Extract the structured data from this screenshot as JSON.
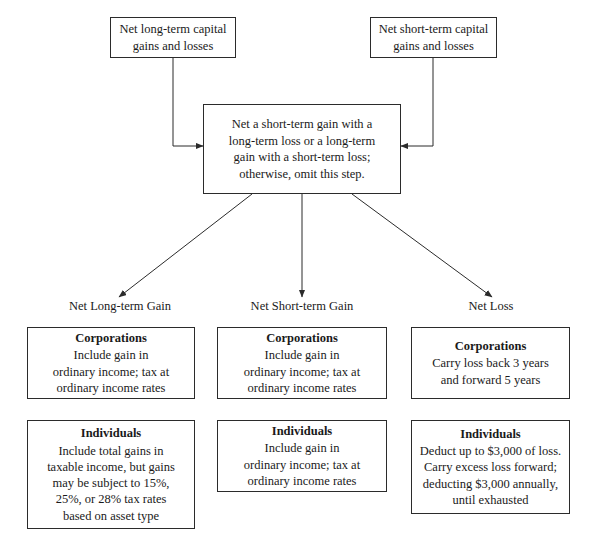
{
  "diagram": {
    "title_artifact": "",
    "stroke_color": "#2b2b2b",
    "background_color": "#ffffff",
    "sources": [
      {
        "id": "net-long-term",
        "text": "Net long-term capital\ngains and losses"
      },
      {
        "id": "net-short-term",
        "text": "Net short-term capital\ngains and losses"
      }
    ],
    "process": {
      "id": "netting-step",
      "text": "Net a short-term gain with a\nlong-term loss or a long-term\ngain with a short-term loss;\notherwise, omit this step."
    },
    "branches": [
      {
        "id": "net-long-term-gain",
        "label": "Net Long-term Gain"
      },
      {
        "id": "net-short-term-gain",
        "label": "Net Short-term Gain"
      },
      {
        "id": "net-loss",
        "label": "Net Loss"
      }
    ],
    "outcomes": [
      {
        "column": "net-long-term-gain",
        "corporations": {
          "heading": "Corporations",
          "body": "Include gain in\nordinary income; tax at\nordinary income rates"
        },
        "individuals": {
          "heading": "Individuals",
          "body": "Include total gains in\ntaxable income, but gains\nmay be subject to 15%,\n25%, or 28% tax rates\nbased on asset type"
        }
      },
      {
        "column": "net-short-term-gain",
        "corporations": {
          "heading": "Corporations",
          "body": "Include gain in\nordinary income; tax at\nordinary income rates"
        },
        "individuals": {
          "heading": "Individuals",
          "body": "Include gain in\nordinary income; tax at\nordinary income rates"
        }
      },
      {
        "column": "net-loss",
        "corporations": {
          "heading": "Corporations",
          "body": "Carry loss back 3 years\nand forward 5 years"
        },
        "individuals": {
          "heading": "Individuals",
          "body": "Deduct up to $3,000 of loss.\nCarry excess loss forward;\ndeducting $3,000 annually,\nuntil exhausted"
        }
      }
    ]
  }
}
